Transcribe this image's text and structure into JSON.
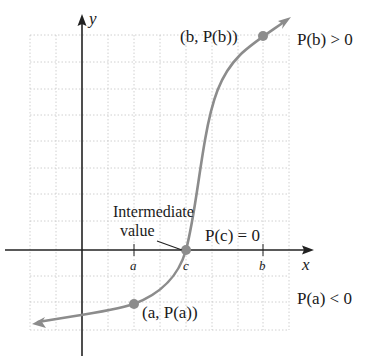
{
  "figure": {
    "axes": {
      "x_label": "x",
      "y_label": "y"
    },
    "ticks": {
      "a": "a",
      "c": "c",
      "b": "b"
    },
    "points": {
      "a_point": "(a, P(a))",
      "b_point": "(b, P(b))"
    },
    "annotations": {
      "intermediate_line1": "Intermediate",
      "intermediate_line2": "value",
      "pc_zero": "P(c) = 0",
      "pb_positive": "P(b) > 0",
      "pa_negative": "P(a) < 0"
    },
    "colors": {
      "curve": "#8c8c8c",
      "axis": "#222222",
      "grid": "#bdbdbd"
    }
  }
}
